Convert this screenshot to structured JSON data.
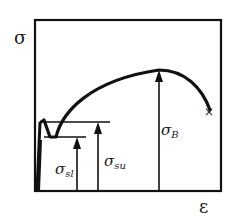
{
  "diagram": {
    "title": "",
    "type": "stress-strain curve",
    "axes": {
      "y_label": "σ",
      "x_label": "ε"
    },
    "annotations": [
      {
        "id": "sigma_sl",
        "base": "σ",
        "sub": "sl",
        "meaning": "lower yield stress"
      },
      {
        "id": "sigma_su",
        "base": "σ",
        "sub": "su",
        "meaning": "upper yield stress"
      },
      {
        "id": "sigma_B",
        "base": "σ",
        "sub": "B",
        "meaning": "ultimate tensile strength"
      }
    ],
    "fracture_marker": "×",
    "colors": {
      "line": "#111111",
      "background": "#ffffff"
    }
  }
}
